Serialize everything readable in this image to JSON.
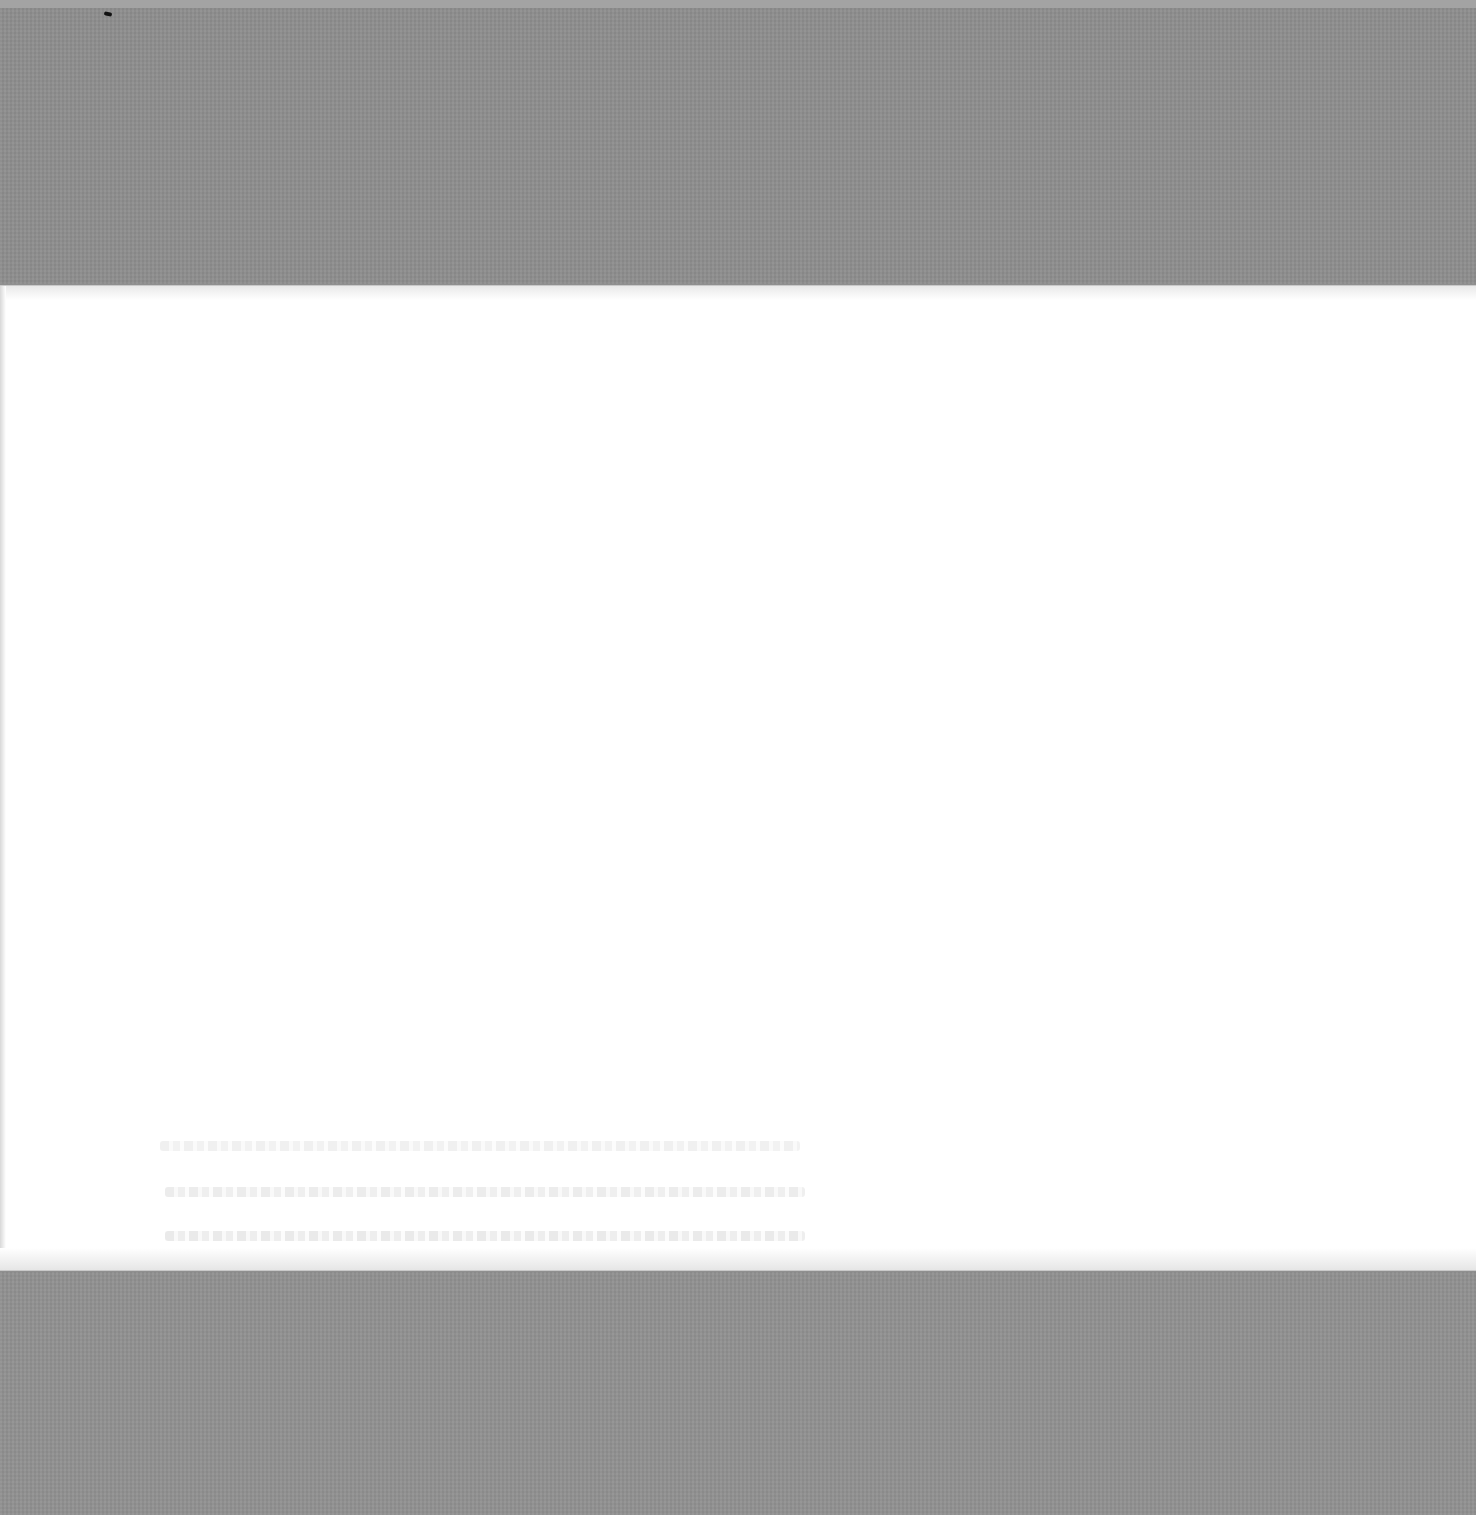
{
  "document": {
    "type": "scanned-page",
    "page_state": "blank",
    "visible_text": [],
    "bleed_through_lines": 3,
    "colors": {
      "scanner_bed": "#8f8f8f",
      "paper": "#ffffff",
      "bleed_through": "#e6e6e6"
    }
  }
}
